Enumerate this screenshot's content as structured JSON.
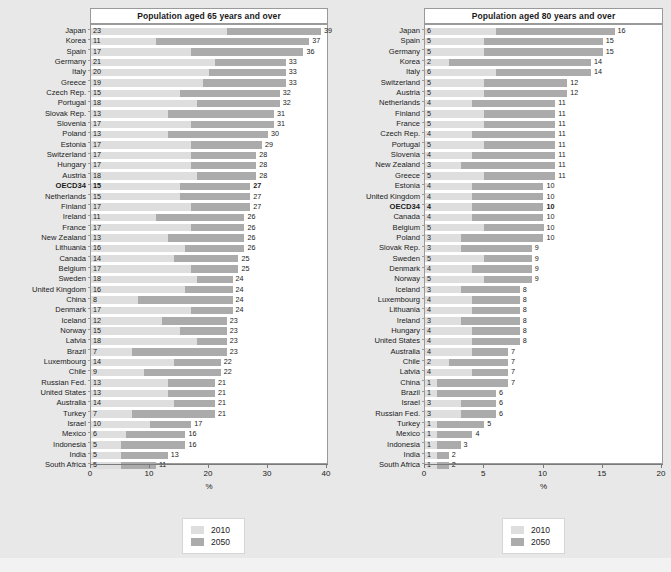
{
  "colors": {
    "background": "#e8e8e8",
    "panel": "#ffffff",
    "series_2010": "#dedede",
    "series_2050": "#ababab",
    "axis": "#7a7a7a",
    "text": "#1a1a1a"
  },
  "legend": {
    "items": [
      {
        "label": "2010",
        "color": "#dedede",
        "name": "legend-swatch-2010"
      },
      {
        "label": "2050",
        "color": "#ababab",
        "name": "legend-swatch-2050"
      }
    ]
  },
  "chart_data": [
    {
      "type": "bar",
      "orientation": "horizontal",
      "title": "Population aged 65 years and over",
      "xlabel": "%",
      "ylabel": "",
      "xlim": [
        0,
        40
      ],
      "xticks": [
        0,
        10,
        20,
        30,
        40
      ],
      "grid": false,
      "legend_position": "bottom",
      "highlight_category": "OECD34",
      "categories": [
        "Japan",
        "Korea",
        "Spain",
        "Germany",
        "Italy",
        "Greece",
        "Czech Rep.",
        "Portugal",
        "Slovak Rep.",
        "Slovenia",
        "Poland",
        "Estonia",
        "Switzerland",
        "Hungary",
        "Austria",
        "OECD34",
        "Netherlands",
        "Finland",
        "Ireland",
        "France",
        "New Zealand",
        "Lithuania",
        "Canada",
        "Belgium",
        "Sweden",
        "United Kingdom",
        "China",
        "Denmark",
        "Iceland",
        "Norway",
        "Latvia",
        "Brazil",
        "Luxembourg",
        "Chile",
        "Russian Fed.",
        "United States",
        "Australia",
        "Turkey",
        "Israel",
        "Mexico",
        "Indonesia",
        "India",
        "South Africa"
      ],
      "series": [
        {
          "name": "2010",
          "values": [
            23,
            11,
            17,
            21,
            20,
            19,
            15,
            18,
            13,
            17,
            13,
            17,
            17,
            17,
            18,
            15,
            15,
            17,
            11,
            17,
            13,
            16,
            14,
            17,
            18,
            16,
            8,
            17,
            12,
            15,
            18,
            7,
            14,
            9,
            13,
            13,
            14,
            7,
            10,
            6,
            5,
            5,
            5
          ]
        },
        {
          "name": "2050",
          "values": [
            39,
            37,
            36,
            33,
            33,
            33,
            32,
            32,
            31,
            31,
            30,
            29,
            28,
            28,
            28,
            27,
            27,
            27,
            26,
            26,
            26,
            26,
            25,
            25,
            24,
            24,
            24,
            24,
            23,
            23,
            23,
            23,
            22,
            22,
            21,
            21,
            21,
            21,
            17,
            16,
            16,
            13,
            11
          ]
        }
      ]
    },
    {
      "type": "bar",
      "orientation": "horizontal",
      "title": "Population aged 80 years and over",
      "xlabel": "%",
      "ylabel": "",
      "xlim": [
        0,
        20
      ],
      "xticks": [
        0,
        5,
        10,
        15,
        20
      ],
      "grid": false,
      "legend_position": "bottom",
      "highlight_category": "OECD34",
      "categories": [
        "Japan",
        "Spain",
        "Germany",
        "Korea",
        "Italy",
        "Switzerland",
        "Austria",
        "Netherlands",
        "Finland",
        "France",
        "Czech Rep.",
        "Portugal",
        "Slovenia",
        "New Zealand",
        "Greece",
        "Estonia",
        "United Kingdom",
        "OECD34",
        "Canada",
        "Belgium",
        "Poland",
        "Slovak Rep.",
        "Sweden",
        "Denmark",
        "Norway",
        "Iceland",
        "Luxembourg",
        "Lithuania",
        "Ireland",
        "Hungary",
        "United States",
        "Australia",
        "Chile",
        "Latvia",
        "China",
        "Brazil",
        "Israel",
        "Russian Fed.",
        "Turkey",
        "Mexico",
        "Indonesia",
        "India",
        "South Africa"
      ],
      "series": [
        {
          "name": "2010",
          "values": [
            6,
            5,
            5,
            2,
            6,
            5,
            5,
            4,
            5,
            5,
            4,
            5,
            4,
            3,
            5,
            4,
            4,
            4,
            4,
            5,
            3,
            3,
            5,
            4,
            5,
            3,
            4,
            4,
            3,
            4,
            4,
            4,
            2,
            4,
            1,
            1,
            3,
            3,
            1,
            1,
            1,
            1,
            1
          ]
        },
        {
          "name": "2050",
          "values": [
            16,
            15,
            15,
            14,
            14,
            12,
            12,
            11,
            11,
            11,
            11,
            11,
            11,
            11,
            11,
            10,
            10,
            10,
            10,
            10,
            10,
            9,
            9,
            9,
            9,
            8,
            8,
            8,
            8,
            8,
            8,
            7,
            7,
            7,
            7,
            6,
            6,
            6,
            5,
            4,
            3,
            2,
            2
          ]
        }
      ]
    }
  ]
}
